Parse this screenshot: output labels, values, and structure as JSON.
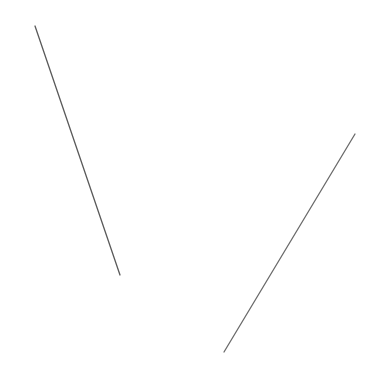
{
  "canvas": {
    "width": 377,
    "height": 365,
    "background": "#ffffff"
  },
  "segments": [
    {
      "id": "segment-left",
      "x1": 35,
      "y1": 26,
      "x2": 120,
      "y2": 275,
      "color": "#5a5a5a",
      "width": 1.3
    },
    {
      "id": "segment-right",
      "x1": 355,
      "y1": 134,
      "x2": 224,
      "y2": 352,
      "color": "#6a6a6a",
      "width": 1.3
    }
  ]
}
